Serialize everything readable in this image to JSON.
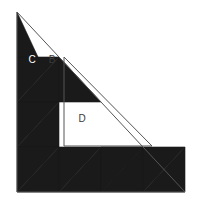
{
  "figure": {
    "background_color": "#ffffff",
    "fill_color": "#1a1a1a",
    "outline_color": "#555555",
    "label_light_color": "#ffffff",
    "label_dark_color": "#3a3a3a"
  },
  "geometry": {
    "apex_x": 17,
    "apex_y": 12,
    "bottom_left_x": 17,
    "bottom_left_y": 192,
    "bottom_right_x": 185,
    "bottom_right_y": 192,
    "rows": 4,
    "columns": 4,
    "cell_width": 42,
    "cell_height": 45
  },
  "labels": [
    {
      "id": "label-c",
      "text": "C",
      "x": 32,
      "y": 60,
      "color": "#ffffff"
    },
    {
      "id": "label-b",
      "text": "B",
      "x": 52,
      "y": 60,
      "color": "#3a3a3a"
    },
    {
      "id": "label-d",
      "text": "D",
      "x": 82,
      "y": 119,
      "color": "#3a3a3a"
    }
  ],
  "shapes": {
    "outer_triangle": "17,12 17,192 185,192",
    "inner_triangle_d": "64,57 64,146 152,146",
    "filled_triangles": [
      "17,57 59,57 17,102",
      "59,57 59,102 17,102",
      "17,102 59,102 17,147",
      "59,102 59,147 17,147",
      "17,147 59,147 17,192",
      "17,192 59,147 59,192",
      "59,192 101,147 101,192",
      "101,147 101,192 143,147",
      "143,147 143,192 101,192",
      "143,192 185,147 185,192",
      "59,147 101,147 59,192",
      "101,147 143,147 101,192",
      "143,147 185,147 143,192",
      "59,57 101,102 59,102",
      "17,12 17,57 38,57"
    ]
  }
}
